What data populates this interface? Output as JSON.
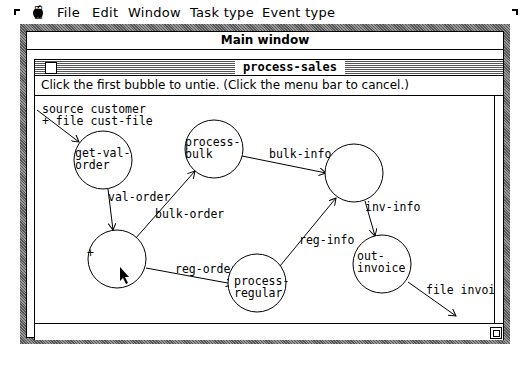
{
  "menubar": {
    "apple_icon": "",
    "items": [
      {
        "label": "File"
      },
      {
        "label": "Edit"
      },
      {
        "label": "Window"
      },
      {
        "label": "Task type"
      },
      {
        "label": "Event type"
      }
    ]
  },
  "main_window": {
    "title": "Main window"
  },
  "diagram_window": {
    "title": "process-sales",
    "prompt": "Click the first bubble to untie. (Click the menu bar to cancel.)"
  },
  "diagram": {
    "external_inputs": [
      {
        "label_line1": "source customer",
        "label_line2": "+ file cust-file"
      }
    ],
    "bubbles": [
      {
        "id": "b1",
        "line1": "get-val-",
        "line2": "order"
      },
      {
        "id": "b2",
        "line1": "process-",
        "line2": "bulk"
      },
      {
        "id": "b3",
        "line1": "",
        "line2": ""
      },
      {
        "id": "b4",
        "line1": "",
        "line2": "",
        "selected": true
      },
      {
        "id": "b5",
        "line1": "process-",
        "line2": "regular"
      },
      {
        "id": "b6",
        "line1": "out-",
        "line2": "invoice"
      }
    ],
    "flows": [
      {
        "label": "val-order"
      },
      {
        "label": "bulk-order"
      },
      {
        "label": "bulk-info"
      },
      {
        "label": "reg-order"
      },
      {
        "label": "reg-info"
      },
      {
        "label": "inv-info"
      },
      {
        "label": "file invoice"
      }
    ]
  }
}
